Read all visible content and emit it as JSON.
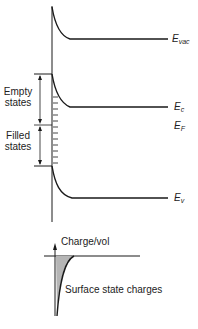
{
  "diagram": {
    "band_labels": {
      "vacuum": {
        "main": "E",
        "sub": "vac"
      },
      "conduction": {
        "main": "E",
        "sub": "c"
      },
      "fermi": {
        "main": "E",
        "sub": "F"
      },
      "valence": {
        "main": "E",
        "sub": "v"
      }
    },
    "state_labels": {
      "empty_line1": "Empty",
      "empty_line2": "states",
      "filled_line1": "Filled",
      "filled_line2": "states"
    },
    "charge_plot": {
      "axis_label": "Charge/vol",
      "annotation": "Surface state charges"
    },
    "colors": {
      "line": "#1a1a1a",
      "shade": "#b5b5b5"
    }
  }
}
